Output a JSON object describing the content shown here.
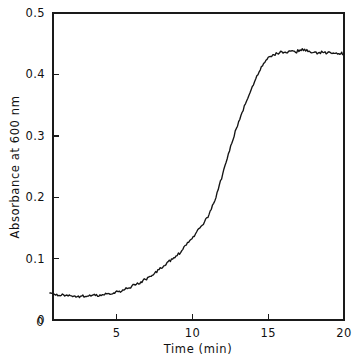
{
  "chart_data": {
    "type": "line",
    "title": "",
    "xlabel": "Time (min)",
    "ylabel": "Absorbance at 600 nm",
    "xlim": [
      0.6,
      20
    ],
    "ylim": [
      0,
      0.5
    ],
    "grid": false,
    "legend": null,
    "xticks": [
      5,
      10,
      15,
      20
    ],
    "xtick_labels": [
      "5",
      "10",
      "15",
      "20"
    ],
    "x_origin_label": "0",
    "yticks": [
      0,
      0.1,
      0.2,
      0.3,
      0.4,
      0.5
    ],
    "ytick_labels": [
      "0",
      "0.1",
      "0.2",
      "0.3",
      "0.4",
      "0.5"
    ],
    "series": [
      {
        "name": "growth-curve",
        "color": "#141414",
        "x": [
          0.6,
          0.9,
          1.2,
          1.5,
          1.8,
          2.1,
          2.4,
          2.7,
          3.0,
          3.3,
          3.6,
          3.9,
          4.2,
          4.5,
          4.8,
          5.1,
          5.4,
          5.7,
          6.0,
          6.3,
          6.6,
          6.9,
          7.2,
          7.5,
          7.8,
          8.1,
          8.4,
          8.7,
          9.0,
          9.3,
          9.6,
          9.9,
          10.2,
          10.5,
          10.8,
          11.1,
          11.4,
          11.7,
          12.0,
          12.3,
          12.6,
          12.9,
          13.2,
          13.5,
          13.8,
          14.1,
          14.4,
          14.7,
          15.0,
          15.3,
          15.6,
          15.9,
          16.2,
          16.5,
          16.8,
          17.1,
          17.4,
          17.7,
          18.0,
          18.3,
          18.6,
          18.9,
          19.2,
          19.5,
          19.8,
          20.0
        ],
        "y": [
          0.044,
          0.042,
          0.04,
          0.041,
          0.039,
          0.038,
          0.038,
          0.039,
          0.038,
          0.039,
          0.04,
          0.041,
          0.041,
          0.043,
          0.044,
          0.046,
          0.049,
          0.051,
          0.055,
          0.058,
          0.062,
          0.066,
          0.071,
          0.076,
          0.082,
          0.088,
          0.095,
          0.099,
          0.105,
          0.113,
          0.122,
          0.131,
          0.14,
          0.15,
          0.16,
          0.172,
          0.19,
          0.212,
          0.238,
          0.263,
          0.288,
          0.312,
          0.333,
          0.352,
          0.37,
          0.388,
          0.404,
          0.418,
          0.428,
          0.432,
          0.434,
          0.437,
          0.435,
          0.438,
          0.436,
          0.44,
          0.441,
          0.438,
          0.436,
          0.435,
          0.436,
          0.435,
          0.434,
          0.435,
          0.434,
          0.434
        ]
      }
    ]
  },
  "figure": {
    "background_color": "#ffffff",
    "axis_color": "#1a1a1a",
    "curve_color": "#141414"
  }
}
